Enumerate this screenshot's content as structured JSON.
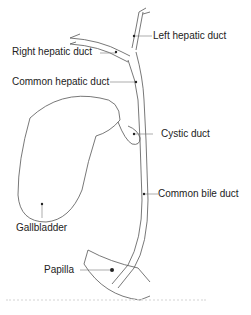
{
  "diagram": {
    "type": "anatomical illustration",
    "labels": [
      {
        "id": "left_hepatic_duct",
        "text": "Left hepatic duct"
      },
      {
        "id": "right_hepatic_duct",
        "text": "Right hepatic duct"
      },
      {
        "id": "common_hepatic_duct",
        "text": "Common hepatic duct"
      },
      {
        "id": "cystic_duct",
        "text": "Cystic duct"
      },
      {
        "id": "common_bile_duct",
        "text": "Common bile duct"
      },
      {
        "id": "gallbladder",
        "text": "Gallbladder"
      },
      {
        "id": "papilla",
        "text": "Papilla"
      }
    ],
    "colors": {
      "line": "#555555",
      "text": "#222222",
      "background": "#ffffff"
    }
  }
}
